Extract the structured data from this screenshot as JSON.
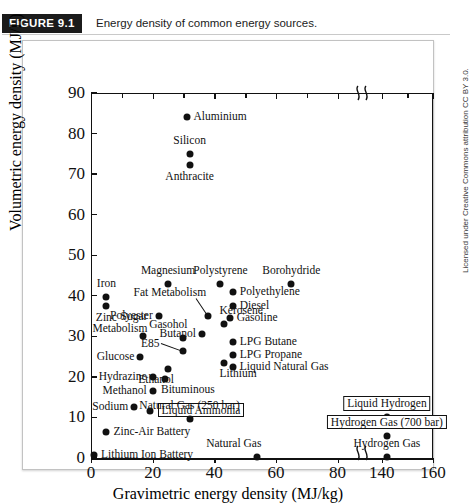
{
  "caption": {
    "figure_tag": "FIGURE 9.1",
    "text": "Energy density of common energy sources."
  },
  "credit": "Licensed under Creative Commons attribution CC BY 3.0.",
  "chart_data": {
    "type": "scatter",
    "title": "Energy density of common energy sources.",
    "xlabel": "Gravimetric energy density (MJ/kg)",
    "ylabel": "Volumetric energy density (MJ/L)",
    "xlim": [
      0,
      160
    ],
    "ylim": [
      0,
      90
    ],
    "grid": false,
    "legend": null,
    "axis_break": {
      "axis": "x",
      "from": 85,
      "to": 135
    },
    "xticks": [
      0,
      20,
      40,
      60,
      80,
      140,
      160
    ],
    "yticks": [
      0,
      10,
      20,
      30,
      40,
      50,
      60,
      70,
      80,
      90
    ],
    "points": [
      {
        "label": "Aluminium",
        "x": 31,
        "y": 84.0,
        "pos": "right"
      },
      {
        "label": "Silicon",
        "x": 32,
        "y": 75.0,
        "pos": "above"
      },
      {
        "label": "Anthracite",
        "x": 32,
        "y": 72.3,
        "pos": "below"
      },
      {
        "label": "Magnesium",
        "x": 25,
        "y": 43.0,
        "pos": "above"
      },
      {
        "label": "Polystyrene",
        "x": 42,
        "y": 43.0,
        "pos": "above"
      },
      {
        "label": "Borohydride",
        "x": 65,
        "y": 43.0,
        "pos": "above"
      },
      {
        "label": "Iron",
        "x": 5,
        "y": 39.8,
        "pos": "above"
      },
      {
        "label": "Polyethylene",
        "x": 46,
        "y": 41.0,
        "pos": "right"
      },
      {
        "label": "Zinc",
        "x": 5,
        "y": 37.5,
        "pos": "below"
      },
      {
        "label": "Diesel",
        "x": 46,
        "y": 37.5,
        "pos": "right"
      },
      {
        "label": "Polyester",
        "x": 22,
        "y": 35.0,
        "pos": "left"
      },
      {
        "label": "Gasoline",
        "x": 45,
        "y": 34.5,
        "pos": "right"
      },
      {
        "label": "Fat Metabolism",
        "x": 38,
        "y": 35.0,
        "pos": "leader-up-left"
      },
      {
        "label": "Kerosene",
        "x": 43,
        "y": 33.0,
        "pos": "above-right"
      },
      {
        "label": "Butanol",
        "x": 36,
        "y": 30.5,
        "pos": "left"
      },
      {
        "label": "Sugar Metabolism",
        "x": 17,
        "y": 30.0,
        "pos": "above-left"
      },
      {
        "label": "LPG Butane",
        "x": 46,
        "y": 28.5,
        "pos": "right"
      },
      {
        "label": "Gasohol",
        "x": 30,
        "y": 29.5,
        "pos": "above-left"
      },
      {
        "label": "E85",
        "x": 30,
        "y": 26.5,
        "pos": "leader-left"
      },
      {
        "label": "LPG Propane",
        "x": 46,
        "y": 25.5,
        "pos": "right"
      },
      {
        "label": "Glucose",
        "x": 16,
        "y": 25.0,
        "pos": "left"
      },
      {
        "label": "Ethanol",
        "x": 25,
        "y": 22.0,
        "pos": "below-left"
      },
      {
        "label": "Liquid Natural Gas",
        "x": 46,
        "y": 22.5,
        "pos": "right"
      },
      {
        "label": "Lithium",
        "x": 43,
        "y": 23.5,
        "pos": "below-right"
      },
      {
        "label": "Hydrazine",
        "x": 20,
        "y": 20.0,
        "pos": "left"
      },
      {
        "label": "Bituminous",
        "x": 24,
        "y": 19.5,
        "pos": "below-right"
      },
      {
        "label": "Methanol",
        "x": 20,
        "y": 16.5,
        "pos": "left"
      },
      {
        "label": "Sodium",
        "x": 14,
        "y": 12.5,
        "pos": "left"
      },
      {
        "label": "Liquid Ammonia",
        "x": 19,
        "y": 11.5,
        "pos": "boxed-right"
      },
      {
        "label": "Natural Gas (250 bar)",
        "x": 32,
        "y": 9.5,
        "pos": "above"
      },
      {
        "label": "Liquid Hydrogen",
        "x": 142,
        "y": 10.0,
        "pos": "boxed-above"
      },
      {
        "label": "Hydrogen Gas (700 bar)",
        "x": 142,
        "y": 5.5,
        "pos": "boxed-above"
      },
      {
        "label": "Zinc-Air Battery",
        "x": 5,
        "y": 6.5,
        "pos": "right"
      },
      {
        "label": "Natural Gas",
        "x": 54,
        "y": 0.3,
        "pos": "above-left"
      },
      {
        "label": "Hydrogen Gas",
        "x": 142,
        "y": 0.3,
        "pos": "above"
      },
      {
        "label": "Lithium Ion Battery",
        "x": 1,
        "y": 0.8,
        "pos": "right"
      }
    ]
  }
}
